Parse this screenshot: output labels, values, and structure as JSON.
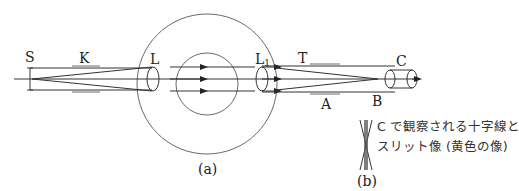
{
  "diagram": {
    "type": "optical spectrometer schematic",
    "labels": {
      "slit": "S",
      "collimator_tube": "K",
      "collimator_lens": "L",
      "telescope_lens": "L",
      "telescope_lens_sub": "1",
      "telescope_tube": "T",
      "eyepiece": "C",
      "telescope_ray_label": "A",
      "focus_point": "B",
      "figure_a": "(a)",
      "figure_b": "(b)"
    },
    "caption_b": {
      "line1": "C で観察される十字線と",
      "line2": "スリット像 (黄色の像)"
    },
    "colors": {
      "stroke": "#333333",
      "background": "#ffffff"
    }
  }
}
